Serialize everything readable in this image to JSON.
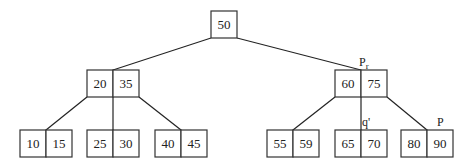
{
  "diagram": {
    "title": "",
    "type": "B-tree",
    "nodes": [
      {
        "id": "root",
        "keys": [
          "50"
        ]
      },
      {
        "id": "n1",
        "keys": [
          "20",
          "35"
        ]
      },
      {
        "id": "n2",
        "keys": [
          "60",
          "75"
        ],
        "label": "Pr"
      },
      {
        "id": "l1",
        "keys": [
          "10",
          "15"
        ]
      },
      {
        "id": "l2",
        "keys": [
          "25",
          "30"
        ]
      },
      {
        "id": "l3",
        "keys": [
          "40",
          "45"
        ]
      },
      {
        "id": "l4",
        "keys": [
          "55",
          "59"
        ]
      },
      {
        "id": "l5",
        "keys": [
          "65",
          "70"
        ],
        "label": "q'"
      },
      {
        "id": "l6",
        "keys": [
          "80",
          "90"
        ],
        "label": "P"
      }
    ],
    "edges": [
      [
        "root",
        "n1"
      ],
      [
        "root",
        "n2"
      ],
      [
        "n1",
        "l1"
      ],
      [
        "n1",
        "l2"
      ],
      [
        "n1",
        "l3"
      ],
      [
        "n2",
        "l4"
      ],
      [
        "n2",
        "l5"
      ],
      [
        "n2",
        "l6"
      ]
    ]
  }
}
